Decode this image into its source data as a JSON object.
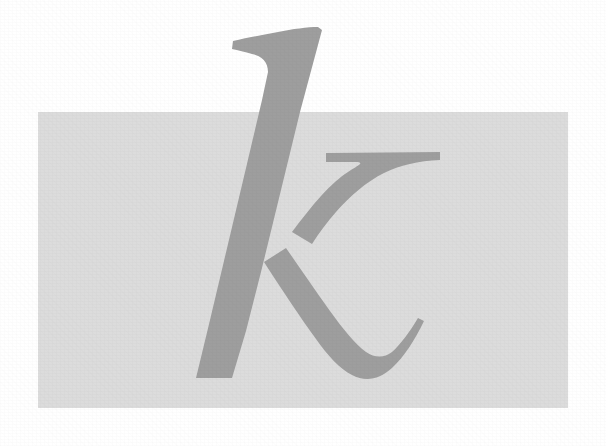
{
  "page": {
    "width": 606,
    "height": 446,
    "background_color": "#ffffff",
    "medium": "scanned print"
  },
  "artwork": {
    "type": "letterform-illustration",
    "glyph": "k",
    "glyph_description": "Large italic calligraphic lowercase letter k (kappa)",
    "glyph_color": "#9e9e9e",
    "glyph_alt_text": "k",
    "panel": {
      "name": "gray-panel",
      "shape": "rectangle",
      "fill_color": "#dcdcdc",
      "x": 38,
      "y": 112,
      "width": 530,
      "height": 296
    },
    "strokes": [
      {
        "name": "ascender-stem",
        "description": "Tall slanted stem with flag serif at top, running from top apex down to the foot"
      },
      {
        "name": "upper-arm",
        "description": "Horizontal hooked arm sweeping to the right from the middle of the stem"
      },
      {
        "name": "lower-leg-tail",
        "description": "Diagonal leg descending to the right and curving into an upturned tail"
      }
    ],
    "bounds": {
      "top": 27,
      "bottom": 380,
      "left": 195,
      "right": 440
    }
  }
}
